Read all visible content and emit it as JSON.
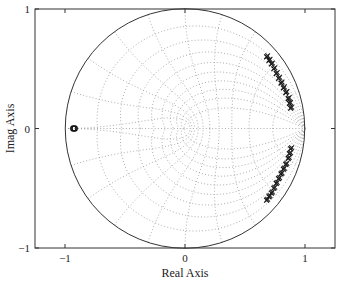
{
  "chart_data": {
    "type": "scatter",
    "title": "",
    "xlabel": "Real Axis",
    "ylabel": "Imag Axis",
    "xlim": [
      -1.25,
      1.25
    ],
    "ylim": [
      -1,
      1
    ],
    "x_ticks": [
      -1,
      0,
      1
    ],
    "x_tick_labels": [
      "−1",
      "0",
      "1"
    ],
    "y_ticks": [
      -1,
      0,
      1
    ],
    "y_tick_labels": [
      "−1",
      "0",
      "1"
    ],
    "grid": "z-plane damping/natural-frequency grid (dotted)",
    "unit_circle": true,
    "series": [
      {
        "name": "zeros",
        "marker": "o",
        "points": [
          [
            -0.93,
            0.0
          ],
          [
            -0.92,
            0.0
          ]
        ]
      },
      {
        "name": "poles-upper",
        "marker": "x",
        "points": [
          [
            0.68,
            0.6
          ],
          [
            0.7,
            0.57
          ],
          [
            0.72,
            0.54
          ],
          [
            0.74,
            0.5
          ],
          [
            0.76,
            0.46
          ],
          [
            0.78,
            0.42
          ],
          [
            0.8,
            0.38
          ],
          [
            0.82,
            0.34
          ],
          [
            0.84,
            0.3
          ],
          [
            0.86,
            0.25
          ],
          [
            0.87,
            0.21
          ],
          [
            0.88,
            0.17
          ]
        ]
      },
      {
        "name": "poles-lower",
        "marker": "x",
        "points": [
          [
            0.88,
            -0.17
          ],
          [
            0.87,
            -0.21
          ],
          [
            0.86,
            -0.25
          ],
          [
            0.84,
            -0.3
          ],
          [
            0.82,
            -0.34
          ],
          [
            0.8,
            -0.38
          ],
          [
            0.78,
            -0.42
          ],
          [
            0.76,
            -0.46
          ],
          [
            0.74,
            -0.5
          ],
          [
            0.72,
            -0.54
          ],
          [
            0.7,
            -0.57
          ],
          [
            0.68,
            -0.6
          ]
        ]
      }
    ]
  }
}
